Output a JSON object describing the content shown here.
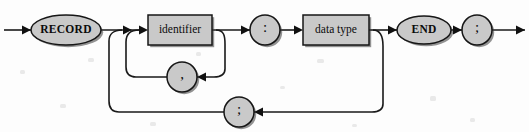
{
  "diagram": {
    "kind": "railroad-syntax-diagram",
    "canvas": {
      "width": 529,
      "height": 132
    },
    "colors": {
      "background": "#fdfdfd",
      "node_fill": "#c9c9c9",
      "node_stroke": "#161616",
      "track": "#1a1a1a",
      "text": "#0b0b0b",
      "shadow": "#3b3b3b"
    },
    "main_track_y": 30,
    "comma_loop_y": 77,
    "semicolon_loop_y": 112,
    "nodes": [
      {
        "id": "record-keyword",
        "name": "node-record-keyword",
        "shape": "ellipse",
        "label": "RECORD",
        "style": "terminal",
        "cx": 66,
        "cy": 30,
        "rx": 35,
        "ry": 15
      },
      {
        "id": "identifier",
        "name": "node-identifier",
        "shape": "rect",
        "label": "identifier",
        "style": "nonterminal",
        "x": 148,
        "y": 15,
        "width": 64,
        "height": 30
      },
      {
        "id": "colon",
        "name": "node-colon",
        "shape": "circle",
        "label": ":",
        "style": "punct",
        "cx": 265,
        "cy": 30,
        "r": 15
      },
      {
        "id": "data-type",
        "name": "node-data-type",
        "shape": "rect",
        "label": "data type",
        "style": "nonterminal",
        "x": 303,
        "y": 15,
        "width": 66,
        "height": 30
      },
      {
        "id": "end-keyword",
        "name": "node-end-keyword",
        "shape": "ellipse",
        "label": "END",
        "style": "terminal",
        "cx": 424,
        "cy": 30,
        "rx": 27,
        "ry": 14
      },
      {
        "id": "statement-semicolon",
        "name": "node-statement-semicolon",
        "shape": "circle",
        "label": ";",
        "style": "punct",
        "cx": 477,
        "cy": 30,
        "r": 15
      },
      {
        "id": "comma-separator",
        "name": "node-comma-separator",
        "shape": "circle",
        "label": ",",
        "style": "punct",
        "cx": 182,
        "cy": 77,
        "r": 15
      },
      {
        "id": "field-semicolon",
        "name": "node-field-semicolon",
        "shape": "circle",
        "label": ";",
        "style": "punct",
        "cx": 239,
        "cy": 112,
        "r": 15
      }
    ],
    "tracks": [
      {
        "id": "entry-line",
        "name": "track-entry",
        "d": "M 4 30 L 31 30"
      },
      {
        "id": "record-to-fork",
        "name": "track-record-to-identifier",
        "d": "M 101 30 L 139 30"
      },
      {
        "id": "identifier-to-colon",
        "name": "track-identifier-to-colon",
        "d": "M 212 30 L 250 30"
      },
      {
        "id": "colon-to-datatype",
        "name": "track-colon-to-datatype",
        "d": "M 280 30 L 294 30"
      },
      {
        "id": "datatype-to-end",
        "name": "track-datatype-to-end",
        "d": "M 369 30 L 397 30"
      },
      {
        "id": "end-to-semicolon",
        "name": "track-end-to-semicolon",
        "d": "M 451 30 L 462 30"
      },
      {
        "id": "exit-line",
        "name": "track-exit",
        "d": "M 492 30 L 525 30"
      },
      {
        "id": "comma-branch-down",
        "name": "track-comma-branch-down",
        "d": "M 216 30 C 224 30 225 36 225 44 L 225 69 C 225 75 221 77 214 77 L 197 77"
      },
      {
        "id": "comma-return-up",
        "name": "track-comma-return-up",
        "d": "M 167 77 L 136 77 C 129 77 126 73 126 67 L 126 42 C 126 34 131 30 139 30"
      },
      {
        "id": "semicolon-branch-down",
        "name": "track-semicolon-branch-down",
        "d": "M 373 30 C 381 30 383 37 383 46 L 383 104 C 383 110 379 112 372 112 L 254 112"
      },
      {
        "id": "semicolon-return-up",
        "name": "track-semicolon-return-up",
        "d": "M 224 112 L 119 112 C 112 112 109 108 109 101 L 109 41 C 109 34 114 30 122 30"
      }
    ],
    "arrowheads": [
      {
        "id": "arrow-entry",
        "name": "arrowhead-entry",
        "x": 31,
        "y": 30,
        "dir": "right"
      },
      {
        "id": "arrow-identifier",
        "name": "arrowhead-into-identifier",
        "x": 148,
        "y": 30,
        "dir": "right"
      },
      {
        "id": "arrow-merge-a",
        "name": "arrowhead-loop-merge-outer",
        "x": 132,
        "y": 30,
        "dir": "right"
      },
      {
        "id": "arrow-colon",
        "name": "arrowhead-into-colon",
        "x": 250,
        "y": 30,
        "dir": "right"
      },
      {
        "id": "arrow-datatype",
        "name": "arrowhead-into-datatype",
        "x": 303,
        "y": 30,
        "dir": "right"
      },
      {
        "id": "arrow-end",
        "name": "arrowhead-into-end",
        "x": 397,
        "y": 30,
        "dir": "right"
      },
      {
        "id": "arrow-stmt-semi",
        "name": "arrowhead-into-semicolon",
        "x": 462,
        "y": 30,
        "dir": "right"
      },
      {
        "id": "arrow-exit",
        "name": "arrowhead-exit",
        "x": 525,
        "y": 30,
        "dir": "right"
      },
      {
        "id": "arrow-comma",
        "name": "arrowhead-into-comma",
        "x": 197,
        "y": 77,
        "dir": "left"
      },
      {
        "id": "arrow-field-semi",
        "name": "arrowhead-into-field-semi",
        "x": 254,
        "y": 112,
        "dir": "left"
      }
    ],
    "specks": [
      {
        "x": 88,
        "y": 58,
        "w": 6,
        "h": 4
      },
      {
        "x": 196,
        "y": 52,
        "w": 5,
        "h": 4
      },
      {
        "x": 317,
        "y": 59,
        "w": 7,
        "h": 4
      },
      {
        "x": 430,
        "y": 96,
        "w": 6,
        "h": 5
      },
      {
        "x": 470,
        "y": 118,
        "w": 5,
        "h": 4
      },
      {
        "x": 60,
        "y": 104,
        "w": 6,
        "h": 4
      },
      {
        "x": 280,
        "y": 86,
        "w": 5,
        "h": 3
      },
      {
        "x": 150,
        "y": 122,
        "w": 6,
        "h": 4
      },
      {
        "x": 352,
        "y": 124,
        "w": 5,
        "h": 3
      },
      {
        "x": 20,
        "y": 70,
        "w": 5,
        "h": 4
      }
    ]
  }
}
